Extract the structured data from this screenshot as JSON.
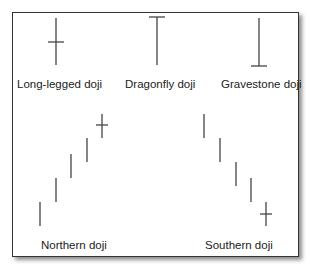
{
  "colors": {
    "stroke": "#444444",
    "text": "#222222",
    "border": "#333333"
  },
  "labels": {
    "long_legged": "Long-legged doji",
    "dragonfly": "Dragonfly doji",
    "gravestone": "Gravestone doji",
    "northern": "Northern doji",
    "southern": "Southern doji"
  },
  "candles": {
    "long_legged": {
      "x": 56,
      "top": 18,
      "bottom": 65,
      "cross_y": 42,
      "half_width": 8
    },
    "dragonfly": {
      "x": 157,
      "top": 17,
      "bottom": 65,
      "cross_y": 17,
      "half_width": 8
    },
    "gravestone": {
      "x": 259,
      "top": 18,
      "bottom": 66,
      "cross_y": 66,
      "half_width": 8
    },
    "northern_trend": [
      {
        "x": 40,
        "top": 202,
        "bottom": 226
      },
      {
        "x": 56,
        "top": 178,
        "bottom": 202
      },
      {
        "x": 71,
        "top": 154,
        "bottom": 178
      },
      {
        "x": 87,
        "top": 138,
        "bottom": 162
      }
    ],
    "northern_doji": {
      "x": 102,
      "top": 114,
      "bottom": 138,
      "cross_y": 125,
      "half_width": 6
    },
    "southern_trend": [
      {
        "x": 204,
        "top": 114,
        "bottom": 138
      },
      {
        "x": 220,
        "top": 138,
        "bottom": 162
      },
      {
        "x": 236,
        "top": 162,
        "bottom": 186
      },
      {
        "x": 251,
        "top": 178,
        "bottom": 202
      }
    ],
    "southern_doji": {
      "x": 266,
      "top": 202,
      "bottom": 226,
      "cross_y": 214,
      "half_width": 6
    }
  }
}
